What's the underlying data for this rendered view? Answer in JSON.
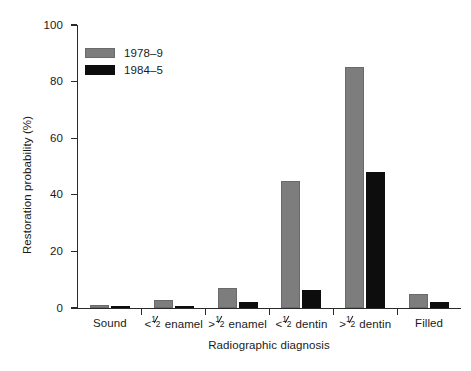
{
  "chart_data": {
    "type": "bar",
    "title": "",
    "subtitle": "",
    "xlabel": "Radiographic diagnosis",
    "ylabel": "Restoration probability (%)",
    "ylim": [
      0,
      100
    ],
    "yticks": [
      0,
      20,
      40,
      60,
      80,
      100
    ],
    "ytick_labels": [
      "0",
      "20",
      "40",
      "60",
      "80",
      "100"
    ],
    "grid": false,
    "legend_position": "top-left inside",
    "categories": [
      "Sound",
      "<1/2 enamel",
      ">1/2 enamel",
      "<1/2 dentin",
      ">1/2 dentin",
      "Filled"
    ],
    "category_label_parts": [
      {
        "prefix": "Sound",
        "fraction": false,
        "suffix": ""
      },
      {
        "prefix": "<",
        "fraction": true,
        "numerator": "1",
        "denominator": "2",
        "suffix": " enamel"
      },
      {
        "prefix": ">",
        "fraction": true,
        "numerator": "1",
        "denominator": "2",
        "suffix": " enamel"
      },
      {
        "prefix": "<",
        "fraction": true,
        "numerator": "1",
        "denominator": "2",
        "suffix": " dentin"
      },
      {
        "prefix": ">",
        "fraction": true,
        "numerator": "1",
        "denominator": "2",
        "suffix": " dentin"
      },
      {
        "prefix": "Filled",
        "fraction": false,
        "suffix": ""
      }
    ],
    "series": [
      {
        "name": "1978–9",
        "color": "#7d7d7d",
        "values": [
          1,
          3,
          7,
          45,
          85,
          5
        ]
      },
      {
        "name": "1984–5",
        "color": "#0d0d0d",
        "values": [
          0.3,
          0.7,
          2,
          6.5,
          48,
          2
        ]
      }
    ]
  },
  "legend": {
    "items": [
      {
        "label": "1978–9",
        "color": "#7d7d7d"
      },
      {
        "label": "1984–5",
        "color": "#0d0d0d"
      }
    ]
  },
  "axes": {
    "y_title": "Restoration probability (%)",
    "x_title": "Radiographic diagnosis"
  }
}
